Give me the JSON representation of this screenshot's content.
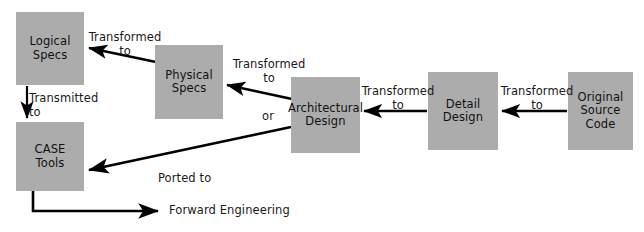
{
  "diagram": {
    "title": "Forward Engineering",
    "type": "flow-diagram",
    "canvas": {
      "width": 644,
      "height": 232
    },
    "colors": {
      "node_fill": "#acacac",
      "arrow": "#000000",
      "text": "#111111",
      "background": "#ffffff"
    },
    "nodes": [
      {
        "id": "logical-specs",
        "label": "Logical\nSpecs",
        "x": 16,
        "y": 12,
        "w": 68,
        "h": 73
      },
      {
        "id": "case-tools",
        "label": "CASE\nTools",
        "x": 16,
        "y": 122,
        "w": 68,
        "h": 69
      },
      {
        "id": "physical-specs",
        "label": "Physical\nSpecs",
        "x": 155,
        "y": 45,
        "w": 68,
        "h": 74
      },
      {
        "id": "architectural-design",
        "label": "Architectural\nDesign",
        "x": 291,
        "y": 77,
        "w": 69,
        "h": 76
      },
      {
        "id": "detail-design",
        "label": "Detail\nDesign",
        "x": 428,
        "y": 72,
        "w": 70,
        "h": 78
      },
      {
        "id": "original-source-code",
        "label": "Original\nSource\nCode",
        "x": 568,
        "y": 72,
        "w": 65,
        "h": 78
      }
    ],
    "edges": [
      {
        "id": "physical-to-logical",
        "label": "Transformed\nto",
        "from": "physical-specs",
        "to": "logical-specs",
        "label_x": 84,
        "label_y": 31,
        "label_w": 82,
        "align": "center"
      },
      {
        "id": "logical-to-case",
        "label": "Transmitted\nto",
        "from": "logical-specs",
        "to": "case-tools",
        "label_x": 29,
        "label_y": 92,
        "label_w": 78,
        "align": "left"
      },
      {
        "id": "architectural-to-physical",
        "label": "Transformed\nto",
        "from": "architectural-design",
        "to": "physical-specs",
        "label_x": 228,
        "label_y": 58,
        "label_w": 82,
        "align": "center"
      },
      {
        "id": "architectural-or",
        "label": "or",
        "from": "architectural-design",
        "to": "",
        "label_x": 258,
        "label_y": 110,
        "label_w": 20,
        "align": "center"
      },
      {
        "id": "detail-to-architectural",
        "label": "Transformed\nto",
        "from": "detail-design",
        "to": "architectural-design",
        "label_x": 358,
        "label_y": 85,
        "label_w": 80,
        "align": "center"
      },
      {
        "id": "source-to-detail",
        "label": "Transformed\nto",
        "from": "original-source-code",
        "to": "detail-design",
        "label_x": 497,
        "label_y": 85,
        "label_w": 80,
        "align": "center"
      },
      {
        "id": "architectural-to-case",
        "label": "Ported to",
        "from": "architectural-design",
        "to": "case-tools",
        "label_x": 158,
        "label_y": 172,
        "label_w": 70,
        "align": "left"
      },
      {
        "id": "forward-engineering",
        "label": "Forward Engineering",
        "from": "case-tools",
        "to": "",
        "label_x": 169,
        "label_y": 204,
        "label_w": 150,
        "align": "left"
      }
    ]
  }
}
